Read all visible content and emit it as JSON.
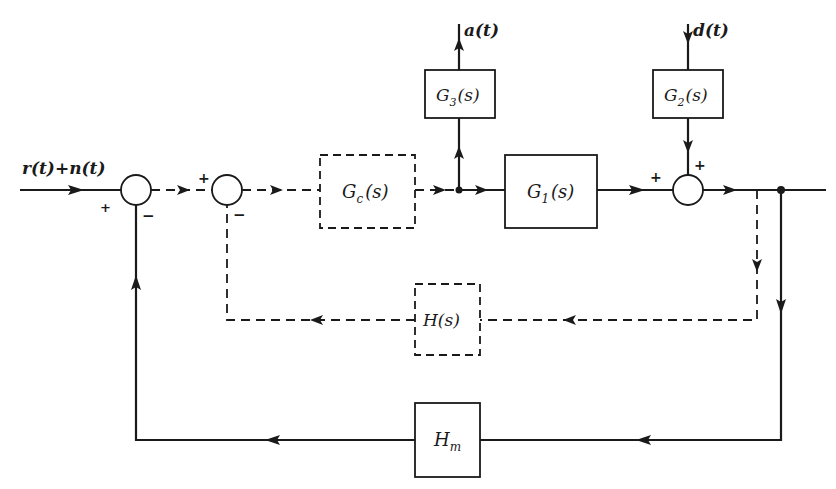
{
  "diagram": {
    "type": "control-system block diagram",
    "input_signal": "r(t)+n(t)",
    "output_signal_a": "a(t)",
    "disturbance_signal": "d(t)",
    "blocks": [
      {
        "id": "Gc",
        "main": "G",
        "sub": "c",
        "arg": "(s)",
        "style": "dashed"
      },
      {
        "id": "G1",
        "main": "G",
        "sub": "1",
        "arg": "(s)",
        "style": "solid"
      },
      {
        "id": "G2",
        "main": "G",
        "sub": "2",
        "arg": "(s)",
        "style": "solid"
      },
      {
        "id": "G3",
        "main": "G",
        "sub": "3",
        "arg": "(s)",
        "style": "solid"
      },
      {
        "id": "H",
        "main": "H",
        "sub": "",
        "arg": "(s)",
        "style": "dashed"
      },
      {
        "id": "Hm",
        "main": "H",
        "sub": "m",
        "arg": "",
        "style": "solid"
      }
    ],
    "summing_junctions": [
      {
        "id": "sum1",
        "signs": {
          "left": "+",
          "bottom": "−"
        }
      },
      {
        "id": "sum2",
        "signs": {
          "left": "+",
          "bottom": "−"
        }
      },
      {
        "id": "sum3",
        "signs": {
          "left": "+",
          "top": "+"
        }
      }
    ],
    "connections": [
      {
        "from": "input",
        "to": "sum1",
        "style": "solid"
      },
      {
        "from": "sum1",
        "to": "sum2",
        "style": "dashed"
      },
      {
        "from": "sum2",
        "to": "Gc",
        "style": "dashed"
      },
      {
        "from": "Gc",
        "to": "branch",
        "style": "dashed"
      },
      {
        "from": "branch",
        "to": "G1",
        "style": "solid"
      },
      {
        "from": "branch",
        "to": "G3",
        "style": "solid"
      },
      {
        "from": "G3",
        "to": "a(t)",
        "style": "solid"
      },
      {
        "from": "d(t)",
        "to": "G2",
        "style": "solid"
      },
      {
        "from": "G2",
        "to": "sum3",
        "style": "solid"
      },
      {
        "from": "G1",
        "to": "sum3",
        "style": "solid"
      },
      {
        "from": "sum3",
        "to": "output",
        "style": "solid"
      },
      {
        "from": "output",
        "to": "H",
        "style": "dashed"
      },
      {
        "from": "H",
        "to": "sum2",
        "style": "dashed"
      },
      {
        "from": "output",
        "to": "Hm",
        "style": "solid"
      },
      {
        "from": "Hm",
        "to": "sum1",
        "style": "solid"
      }
    ]
  },
  "labels": {
    "input": "r(t)+n(t)",
    "a_out": "a(t)",
    "d_in": "d(t)",
    "plus": "+",
    "minus": "−",
    "Gc_main": "G",
    "Gc_sub": "c",
    "Gc_arg": "(s)",
    "G1_main": "G",
    "G1_sub": "1",
    "G1_arg": "(s)",
    "G2_main": "G",
    "G2_sub": "2",
    "G2_arg": "(s)",
    "G3_main": "G",
    "G3_sub": "3",
    "G3_arg": "(s)",
    "H_label": "H(s)",
    "Hm_main": "H",
    "Hm_sub": "m"
  }
}
